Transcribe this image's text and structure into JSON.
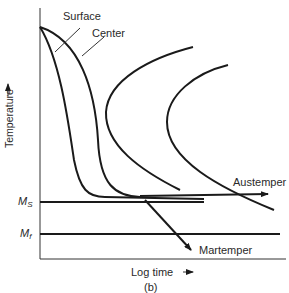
{
  "diagram": {
    "type": "TTT diagram (isothermal transformation) with cooling paths",
    "caption": "(b)",
    "axes": {
      "x_label": "Log time",
      "x_arrow": "→",
      "y_label": "Temperature",
      "y_arrow": "→"
    },
    "levels": {
      "ms": {
        "label": "M",
        "sub": "S"
      },
      "mf": {
        "label": "M",
        "sub": "f"
      }
    },
    "curves": {
      "surface": "Surface",
      "center": "Center"
    },
    "paths": {
      "austemper": "Austemper",
      "martemper": "Martemper"
    },
    "colors": {
      "line": "#1a1a1a",
      "text": "#2a2a2a",
      "background": "#ffffff"
    }
  }
}
